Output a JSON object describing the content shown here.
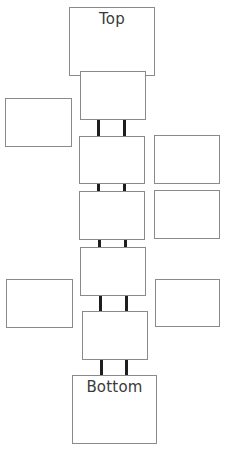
{
  "diagram": {
    "type": "vertical-stack",
    "top_label": "Top",
    "bottom_label": "Bottom",
    "colors": {
      "box_border": "#8a8a8a",
      "connector": "#1e1e1e",
      "text": "#3a3a3a",
      "background": "#ffffff"
    },
    "boxes": [
      {
        "id": "top",
        "label": "Top",
        "x": 69,
        "y": 7,
        "w": 86,
        "h": 69
      },
      {
        "id": "stack-1",
        "label": "",
        "x": 80,
        "y": 71,
        "w": 66,
        "h": 49
      },
      {
        "id": "side-left-1",
        "label": "",
        "x": 5,
        "y": 98,
        "w": 67,
        "h": 49
      },
      {
        "id": "stack-2",
        "label": "",
        "x": 79,
        "y": 136,
        "w": 66,
        "h": 48
      },
      {
        "id": "side-right-1",
        "label": "",
        "x": 154,
        "y": 135,
        "w": 66,
        "h": 49
      },
      {
        "id": "stack-3",
        "label": "",
        "x": 79,
        "y": 191,
        "w": 66,
        "h": 49
      },
      {
        "id": "side-right-2",
        "label": "",
        "x": 154,
        "y": 190,
        "w": 66,
        "h": 49
      },
      {
        "id": "stack-4",
        "label": "",
        "x": 80,
        "y": 247,
        "w": 66,
        "h": 49
      },
      {
        "id": "side-left-2",
        "label": "",
        "x": 6,
        "y": 279,
        "w": 67,
        "h": 49
      },
      {
        "id": "side-right-3",
        "label": "",
        "x": 155,
        "y": 279,
        "w": 65,
        "h": 48
      },
      {
        "id": "stack-5",
        "label": "",
        "x": 82,
        "y": 311,
        "w": 66,
        "h": 49
      },
      {
        "id": "bottom",
        "label": "Bottom",
        "x": 72,
        "y": 375,
        "w": 85,
        "h": 69
      }
    ],
    "connectors": [
      {
        "between": [
          "stack-1",
          "stack-2"
        ],
        "y": 119,
        "h": 17,
        "xs": [
          97,
          123
        ]
      },
      {
        "between": [
          "stack-2",
          "stack-3"
        ],
        "y": 183,
        "h": 8,
        "xs": [
          97,
          123
        ]
      },
      {
        "between": [
          "stack-3",
          "stack-4"
        ],
        "y": 239,
        "h": 8,
        "xs": [
          98,
          124
        ]
      },
      {
        "between": [
          "stack-4",
          "stack-5"
        ],
        "y": 295,
        "h": 16,
        "xs": [
          99,
          125
        ]
      },
      {
        "between": [
          "stack-5",
          "bottom"
        ],
        "y": 359,
        "h": 16,
        "xs": [
          100,
          125
        ]
      }
    ]
  }
}
